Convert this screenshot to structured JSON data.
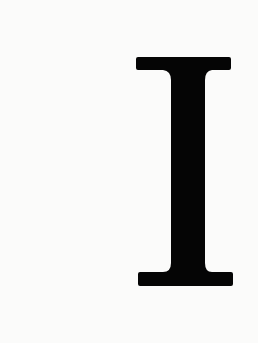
{
  "letter": "I",
  "colors": {
    "background": "#fbfbfa",
    "glyph": "#050505"
  }
}
